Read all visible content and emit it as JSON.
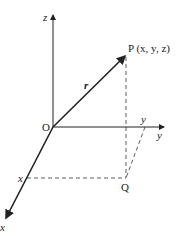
{
  "labels": {
    "z_axis": "z",
    "y_axis": "y",
    "x_axis": "x",
    "origin": "O",
    "point_p": "P (x, y, z)",
    "vector": "r",
    "point_q": "Q",
    "x_mark": "x",
    "y_mark": "y"
  },
  "colors": {
    "line": "#222222",
    "background": "#ffffff"
  }
}
